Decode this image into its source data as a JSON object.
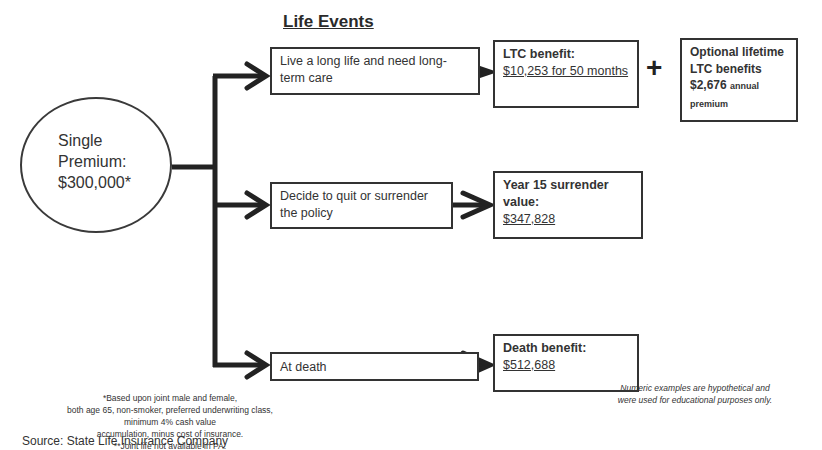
{
  "title": "Life Events",
  "premium": {
    "line1": "Single",
    "line2": "Premium:",
    "line3": "$300,000*"
  },
  "events": [
    {
      "label": "Live a long life and need long-term care"
    },
    {
      "label": "Decide to quit or surrender the policy"
    },
    {
      "label": "At death"
    }
  ],
  "outcomes": [
    {
      "heading": "LTC benefit:",
      "value": "$10,253 for 50 months"
    },
    {
      "heading": "Year 15 surrender value:",
      "value": "$347,828"
    },
    {
      "heading": "Death benefit:",
      "value": "$512,688"
    }
  ],
  "plus_symbol": "+",
  "optional": {
    "heading": "Optional lifetime LTC benefits",
    "amount": "$2,676",
    "suffix": "annual premium"
  },
  "footnote": {
    "line1": "*Based upon joint male and female,",
    "line2": "both age 65, non-smoker, preferred underwriting class,",
    "line3": "minimum 4% cash value",
    "line4": "accumulation, minus cost of insurance.",
    "line5": "**Joint life not available in PA."
  },
  "source": "Source:  State Life Insurance Company",
  "disclaimer": {
    "line1": "Numeric examples are hypothetical and",
    "line2": "were used for educational purposes only."
  }
}
